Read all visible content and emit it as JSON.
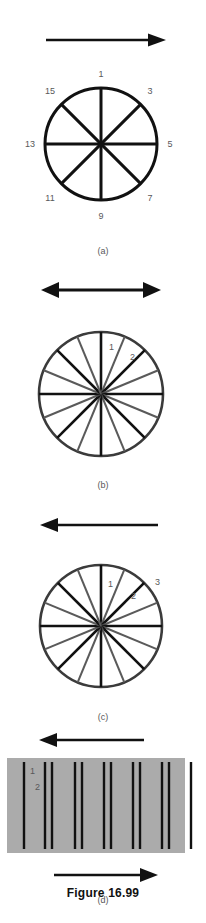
{
  "figure": {
    "title": "Figure 16.99",
    "background_color": "#ffffff",
    "label_color": "#58585a",
    "line_color": "#111111",
    "gray_spoke_color": "#5a5a5a",
    "panel_d_fill": "#ababab"
  },
  "panels": [
    {
      "id": "a",
      "caption": "(a)",
      "kind": "wheel",
      "spoke_count": 8,
      "arrow": {
        "direction": "right",
        "heads": 1,
        "label": ""
      },
      "labels": [
        "1",
        "3",
        "5",
        "7",
        "9",
        "11",
        "13",
        "15"
      ],
      "label_values": {
        "top": "1",
        "upper_right": "3",
        "right": "5",
        "lower_right": "7",
        "bottom": "9",
        "lower_left": "11",
        "left": "13",
        "upper_left": "15"
      }
    },
    {
      "id": "b",
      "caption": "(b)",
      "kind": "wheel",
      "spoke_count": 16,
      "arrow": {
        "direction": "both",
        "heads": 2,
        "label": ""
      },
      "labels": [
        "1",
        "2"
      ],
      "label_values": {
        "spoke1": "1",
        "spoke2": "2"
      }
    },
    {
      "id": "c",
      "caption": "(c)",
      "kind": "wheel",
      "spoke_count": 16,
      "arrow": {
        "direction": "left",
        "heads": 1,
        "label": ""
      },
      "labels": [
        "1",
        "2",
        "3"
      ],
      "label_values": {
        "spoke1": "1",
        "spoke2": "2",
        "spoke3": "3"
      }
    },
    {
      "id": "d",
      "caption": "(d)",
      "kind": "bars",
      "arrow_top": {
        "direction": "left",
        "heads": 1
      },
      "arrow_bottom": {
        "direction": "right",
        "heads": 1
      },
      "labels": [
        "1",
        "2"
      ],
      "label_values": {
        "bar1": "1",
        "bar2": "2"
      },
      "bar_positions": [
        17,
        38,
        45,
        68,
        75,
        97,
        104,
        126,
        133,
        155,
        162,
        184
      ]
    }
  ]
}
